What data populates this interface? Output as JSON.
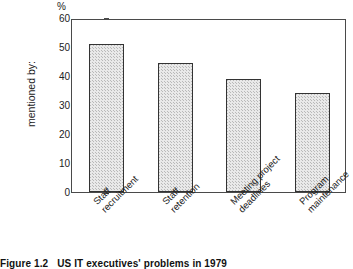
{
  "chart_data": {
    "type": "bar",
    "title": "",
    "categories": [
      "Staff recruitment",
      "Staff retention",
      "Meeting project deadlines",
      "Program maintenance"
    ],
    "category_lines": [
      [
        "Staff",
        "recruitment"
      ],
      [
        "Staff",
        "retention"
      ],
      [
        "Meeting project",
        "deadlines"
      ],
      [
        "Program",
        "maintenance"
      ]
    ],
    "values": [
      51,
      44.5,
      39,
      34
    ],
    "xlabel": "",
    "ylabel": "mentioned by:",
    "yunit": "%",
    "ylim": [
      0,
      60
    ],
    "yticks": [
      60,
      50,
      40,
      30,
      20,
      10,
      0
    ],
    "ytick_labels": [
      "60",
      "50",
      "40",
      "30",
      "20",
      "10",
      "0"
    ],
    "grid": false,
    "legend": false
  },
  "figure": {
    "caption_number": "Figure 1.2",
    "caption_text": "US IT executives' problems in 1979"
  },
  "style": {
    "bar_fill": "#e9e9e9",
    "bar_border": "#333333",
    "frame_color": "#4a4a4a",
    "text_color": "#222222"
  }
}
